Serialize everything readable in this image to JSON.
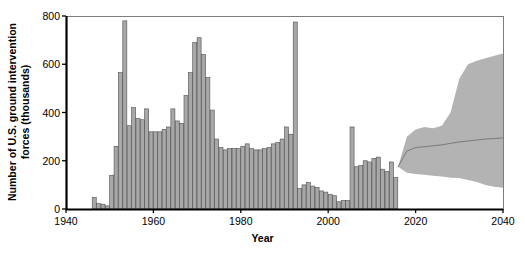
{
  "chart_data": {
    "type": "bar",
    "title": "",
    "xlabel": "Year",
    "ylabel": "Number of U.S. ground intervention forces (thousands)",
    "ylabel_line1": "Number of U.S. ground intervention",
    "ylabel_line2": "forces (thousands)",
    "xlim": [
      1940,
      2040
    ],
    "ylim": [
      0,
      800
    ],
    "xticks": [
      1940,
      1960,
      1980,
      2000,
      2020,
      2040
    ],
    "xticklabels": [
      "1940",
      "1960",
      "1980",
      "2000",
      "2020",
      "2040"
    ],
    "yticks": [
      0,
      200,
      400,
      600,
      800
    ],
    "yticklabels": [
      "0",
      "200",
      "400",
      "600",
      "800"
    ],
    "grid": false,
    "legend": "none",
    "bar_color": "#a8a8a8",
    "bar_edge_color": "#4d4d4d",
    "band_color": "#b3b3b3",
    "median_line_color": "#7a7a7a",
    "axis_color": "#000000",
    "categories": [
      1946,
      1947,
      1948,
      1949,
      1950,
      1951,
      1952,
      1953,
      1954,
      1955,
      1956,
      1957,
      1958,
      1959,
      1960,
      1961,
      1962,
      1963,
      1964,
      1965,
      1966,
      1967,
      1968,
      1969,
      1970,
      1971,
      1972,
      1973,
      1974,
      1975,
      1976,
      1977,
      1978,
      1979,
      1980,
      1981,
      1982,
      1983,
      1984,
      1985,
      1986,
      1987,
      1988,
      1989,
      1990,
      1991,
      1992,
      1993,
      1994,
      1995,
      1996,
      1997,
      1998,
      1999,
      2000,
      2001,
      2002,
      2003,
      2004,
      2005,
      2006,
      2007,
      2008,
      2009,
      2010,
      2011,
      2012,
      2013,
      2014,
      2015
    ],
    "values": [
      48,
      22,
      20,
      13,
      140,
      260,
      565,
      780,
      345,
      420,
      375,
      370,
      415,
      320,
      320,
      320,
      330,
      340,
      415,
      365,
      355,
      470,
      565,
      690,
      710,
      640,
      545,
      410,
      290,
      255,
      245,
      250,
      250,
      250,
      260,
      270,
      250,
      245,
      245,
      250,
      255,
      270,
      275,
      290,
      340,
      310,
      775,
      85,
      100,
      110,
      95,
      90,
      75,
      70,
      60,
      55,
      30,
      35,
      35,
      340,
      175,
      180,
      200,
      195,
      210,
      215,
      165,
      155,
      195,
      130
    ],
    "projection": {
      "label": "projected range",
      "start_year": 2016,
      "end_year": 2040,
      "years": [
        2016,
        2018,
        2020,
        2022,
        2024,
        2026,
        2028,
        2030,
        2032,
        2034,
        2036,
        2038,
        2040
      ],
      "upper": [
        175,
        300,
        330,
        340,
        335,
        345,
        400,
        540,
        600,
        615,
        625,
        635,
        645
      ],
      "lower": [
        175,
        150,
        145,
        142,
        138,
        135,
        130,
        128,
        120,
        112,
        100,
        92,
        88
      ],
      "median": [
        175,
        240,
        255,
        258,
        262,
        266,
        272,
        278,
        282,
        286,
        290,
        292,
        295
      ]
    }
  }
}
